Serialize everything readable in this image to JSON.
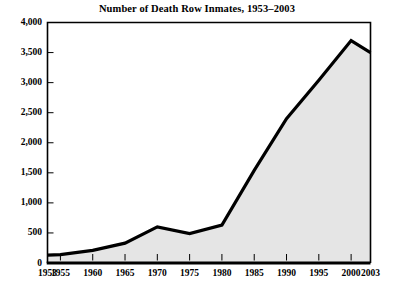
{
  "chart_data": {
    "type": "area",
    "title": "Number of Death Row Inmates, 1953–2003",
    "xlabel": "",
    "ylabel": "",
    "x": [
      1953,
      1955,
      1960,
      1965,
      1970,
      1975,
      1980,
      1985,
      1990,
      1995,
      2000,
      2003
    ],
    "values": [
      130,
      140,
      210,
      330,
      600,
      490,
      630,
      1540,
      2400,
      3040,
      3700,
      3500
    ],
    "xlim": [
      1953,
      2003
    ],
    "ylim": [
      0,
      4000
    ],
    "ytick_values": [
      0,
      500,
      1000,
      1500,
      2000,
      2500,
      3000,
      3500,
      4000
    ],
    "ytick_labels": [
      "0",
      "500",
      "1,000",
      "1,500",
      "2,000",
      "2,500",
      "3,000",
      "3,500",
      "4,000"
    ],
    "xtick_values": [
      1953,
      1955,
      1960,
      1965,
      1970,
      1975,
      1980,
      1985,
      1990,
      1995,
      2000,
      2003
    ],
    "xtick_labels": [
      "1953",
      "1955",
      "1960",
      "1965",
      "1970",
      "1975",
      "1980",
      "1985",
      "1990",
      "1995",
      "2000",
      "2003"
    ],
    "grid": false,
    "legend": null,
    "series": [
      {
        "name": "Death row inmates",
        "values": [
          130,
          140,
          210,
          330,
          600,
          490,
          630,
          1540,
          2400,
          3040,
          3700,
          3500
        ]
      }
    ],
    "colors": {
      "line": "#000000",
      "fill": "#e5e5e5",
      "axis": "#000000",
      "background": "#ffffff",
      "text": "#000000"
    },
    "line_width": 3.2,
    "annotations": []
  }
}
